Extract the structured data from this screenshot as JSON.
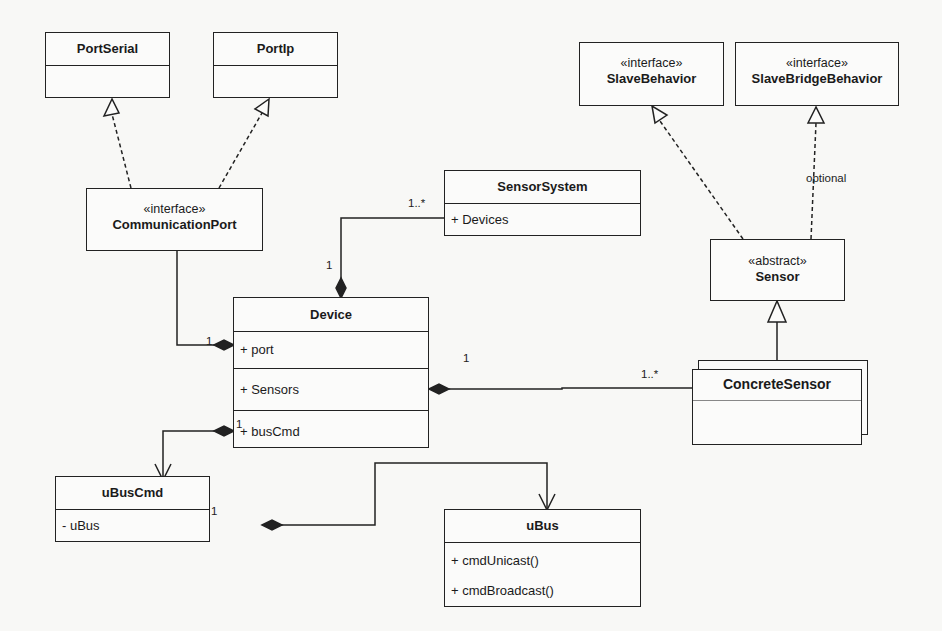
{
  "classes": {
    "port_serial": {
      "name": "PortSerial"
    },
    "port_ip": {
      "name": "PortIp"
    },
    "communication_port": {
      "stereotype": "«interface»",
      "name": "CommunicationPort"
    },
    "slave_behavior": {
      "stereotype": "«interface»",
      "name": "SlaveBehavior"
    },
    "slave_bridge_behavior": {
      "stereotype": "«interface»",
      "name": "SlaveBridgeBehavior"
    },
    "sensor_system": {
      "name": "SensorSystem",
      "attributes": [
        "+ Devices"
      ]
    },
    "device": {
      "name": "Device",
      "attributes": [
        "+ port",
        "+ Sensors",
        "+ busCmd"
      ]
    },
    "sensor": {
      "stereotype": "«abstract»",
      "name": "Sensor"
    },
    "concrete_sensor": {
      "name": "ConcreteSensor"
    },
    "ubuscmd": {
      "name": "uBusCmd",
      "attributes": [
        "- uBus"
      ]
    },
    "ubus": {
      "name": "uBus",
      "methods": [
        "+ cmdUnicast()",
        "+ cmdBroadcast()"
      ]
    }
  },
  "labels": {
    "optional": "optional",
    "sensorsystem_mult": "1..*",
    "device_sys_mult": "1",
    "port_mult": "1",
    "sensors_device_mult": "1",
    "sensors_concrete_mult": "1..*",
    "buscmd_mult": "1",
    "ubus_mult": "1"
  }
}
